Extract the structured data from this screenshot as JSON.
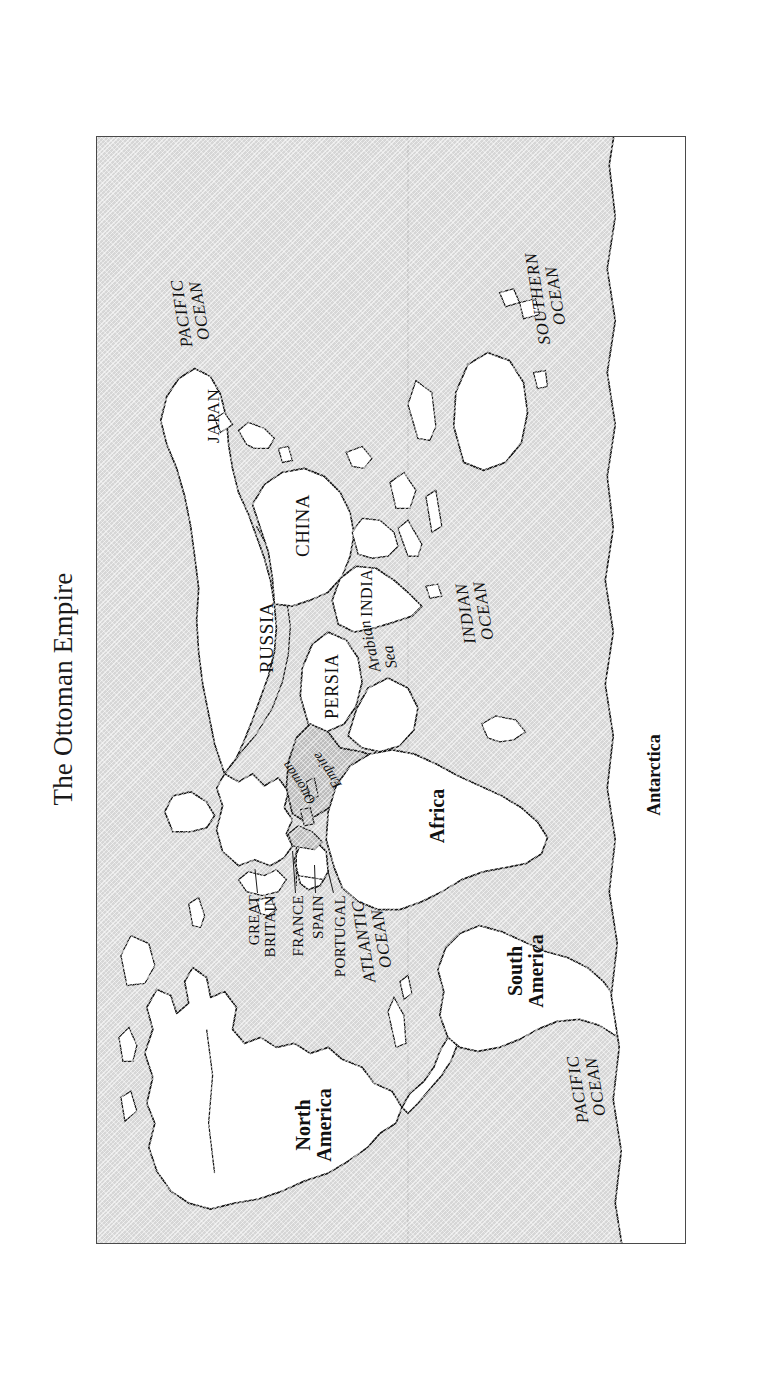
{
  "document": {
    "title": "The Ottoman Empire",
    "orientation": "rotated-90-ccw",
    "figure_type": "world-map"
  },
  "map": {
    "frame": {
      "border_color": "#4a4a4a"
    },
    "ocean_fill": "#d6d6d6",
    "land_fill": "#ffffff",
    "highlight_fill": "#b8b8b8",
    "coastline_color": "#1a1a1a",
    "labels": {
      "countries": [
        {
          "name": "RUSSIA",
          "style": "caps"
        },
        {
          "name": "CHINA",
          "style": "caps"
        },
        {
          "name": "JAPAN",
          "style": "caps"
        },
        {
          "name": "INDIA",
          "style": "caps"
        },
        {
          "name": "PERSIA",
          "style": "caps"
        },
        {
          "name": "GREAT\nBRITAIN",
          "style": "small-caps"
        },
        {
          "name": "FRANCE",
          "style": "small-caps"
        },
        {
          "name": "SPAIN",
          "style": "small-caps"
        },
        {
          "name": "PORTUGAL",
          "style": "small-caps"
        }
      ],
      "highlight": {
        "line1": "Ottoman",
        "line2": "Empire"
      },
      "continents": [
        {
          "name": "North\nAmerica"
        },
        {
          "name": "South\nAmerica"
        },
        {
          "name": "Africa"
        },
        {
          "name": "Antarctica"
        }
      ],
      "oceans": [
        {
          "name": "PACIFIC\nOCEAN",
          "which": "pacific-north"
        },
        {
          "name": "PACIFIC\nOCEAN",
          "which": "pacific-south"
        },
        {
          "name": "ATLANTIC\nOCEAN",
          "which": "atlantic"
        },
        {
          "name": "INDIAN\nOCEAN",
          "which": "indian"
        },
        {
          "name": "SOUTHERN\nOCEAN",
          "which": "southern"
        }
      ],
      "seas": [
        {
          "name": "Arabian\n  Sea"
        }
      ]
    }
  }
}
